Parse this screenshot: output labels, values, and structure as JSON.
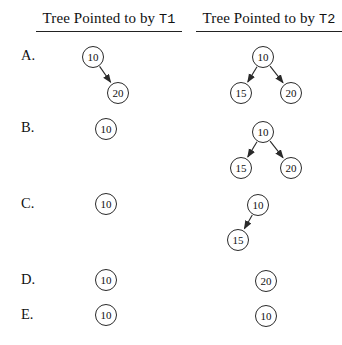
{
  "canvas": {
    "width": 342,
    "height": 345,
    "background": "#ffffff",
    "ink": "#222222",
    "node_radius": 11
  },
  "layout": {
    "label_x": 21
  },
  "columns": [
    {
      "title_prefix": "Tree Pointed to by ",
      "title_code": "T1"
    },
    {
      "title_prefix": "Tree Pointed to by ",
      "title_code": "T2"
    }
  ],
  "rows": [
    {
      "label": "A.",
      "label_y": 56,
      "trees": [
        {
          "column": "T1",
          "nodes": [
            {
              "value": "10",
              "x": 93,
              "y": 57
            },
            {
              "value": "20",
              "x": 118,
              "y": 93
            }
          ],
          "edges": [
            [
              "10",
              "20"
            ]
          ]
        },
        {
          "column": "T2",
          "nodes": [
            {
              "value": "10",
              "x": 263,
              "y": 57
            },
            {
              "value": "15",
              "x": 241,
              "y": 93
            },
            {
              "value": "20",
              "x": 291,
              "y": 93
            }
          ],
          "edges": [
            [
              "10",
              "15"
            ],
            [
              "10",
              "20"
            ]
          ]
        }
      ]
    },
    {
      "label": "B.",
      "label_y": 128,
      "trees": [
        {
          "column": "T1",
          "nodes": [
            {
              "value": "10",
              "x": 106,
              "y": 129
            }
          ],
          "edges": []
        },
        {
          "column": "T2",
          "nodes": [
            {
              "value": "10",
              "x": 263,
              "y": 132
            },
            {
              "value": "15",
              "x": 241,
              "y": 168
            },
            {
              "value": "20",
              "x": 291,
              "y": 168
            }
          ],
          "edges": [
            [
              "10",
              "15"
            ],
            [
              "10",
              "20"
            ]
          ]
        }
      ]
    },
    {
      "label": "C.",
      "label_y": 204,
      "trees": [
        {
          "column": "T1",
          "nodes": [
            {
              "value": "10",
              "x": 106,
              "y": 204
            }
          ],
          "edges": []
        },
        {
          "column": "T2",
          "nodes": [
            {
              "value": "10",
              "x": 258,
              "y": 205
            },
            {
              "value": "15",
              "x": 238,
              "y": 240
            }
          ],
          "edges": [
            [
              "10",
              "15"
            ]
          ]
        }
      ]
    },
    {
      "label": "D.",
      "label_y": 280,
      "trees": [
        {
          "column": "T1",
          "nodes": [
            {
              "value": "10",
              "x": 106,
              "y": 280
            }
          ],
          "edges": []
        },
        {
          "column": "T2",
          "nodes": [
            {
              "value": "20",
              "x": 266,
              "y": 281
            }
          ],
          "edges": []
        }
      ]
    },
    {
      "label": "E.",
      "label_y": 315,
      "trees": [
        {
          "column": "T1",
          "nodes": [
            {
              "value": "10",
              "x": 106,
              "y": 315
            }
          ],
          "edges": []
        },
        {
          "column": "T2",
          "nodes": [
            {
              "value": "10",
              "x": 266,
              "y": 316
            }
          ],
          "edges": []
        }
      ]
    }
  ]
}
